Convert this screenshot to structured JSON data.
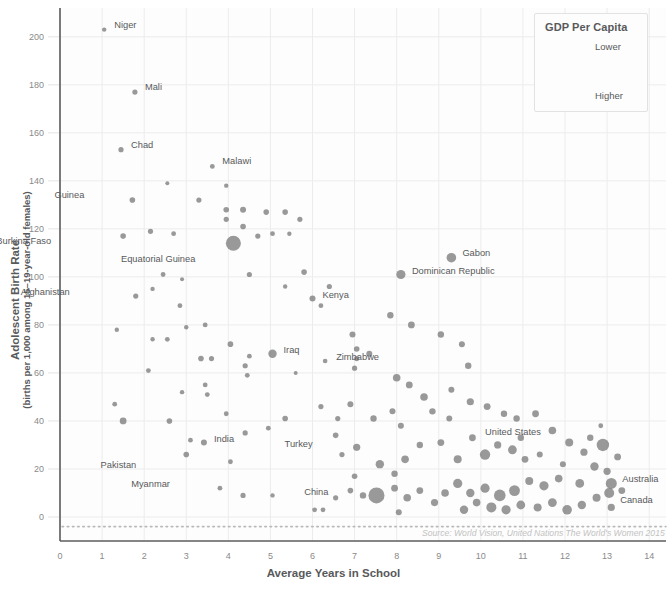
{
  "chart_data": {
    "type": "scatter",
    "title": "",
    "xlabel": "Average Years in School",
    "ylabel": "Adolescent Birth Rate",
    "ylabel_sub": "(births per 1,000 among 15–19-year-old females)",
    "xlim": [
      0,
      14.4
    ],
    "ylim": [
      -10,
      212
    ],
    "xticks": [
      0,
      1,
      2,
      3,
      4,
      5,
      6,
      7,
      8,
      9,
      10,
      11,
      12,
      13,
      14
    ],
    "yticks": [
      0,
      20,
      40,
      60,
      80,
      100,
      120,
      140,
      160,
      180,
      200
    ],
    "grid": true,
    "legend_position": "top-right",
    "size_encodes": "GDP Per Capita",
    "point_color": "#7c7c7c",
    "source": "Source: World Vision, United Nations The World's Women 2015",
    "legend": {
      "title": "GDP Per Capita",
      "low_label": "Lower",
      "high_label": "Higher",
      "arrow": "↓"
    },
    "labeled_points": [
      {
        "name": "Niger",
        "x": 1.05,
        "y": 203,
        "r": 2.2,
        "lx": 10,
        "ly": -5
      },
      {
        "name": "Mali",
        "x": 1.78,
        "y": 177,
        "r": 2.6,
        "lx": 10,
        "ly": -5
      },
      {
        "name": "Chad",
        "x": 1.45,
        "y": 153,
        "r": 2.6,
        "lx": 10,
        "ly": -5
      },
      {
        "name": "Malawi",
        "x": 3.62,
        "y": 146,
        "r": 2.4,
        "lx": 10,
        "ly": -5
      },
      {
        "name": "Guinea",
        "x": 1.72,
        "y": 132,
        "r": 2.8,
        "lx": -48,
        "ly": -5
      },
      {
        "name": "Burkina Faso",
        "x": 1.5,
        "y": 117,
        "r": 2.8,
        "lx": -72,
        "ly": 5
      },
      {
        "name": "Equatorial Guinea",
        "x": 4.12,
        "y": 114,
        "r": 7.5,
        "lx": -38,
        "ly": 16
      },
      {
        "name": "Afghanistan",
        "x": 1.8,
        "y": 92,
        "r": 2.6,
        "lx": -66,
        "ly": -4
      },
      {
        "name": "Gabon",
        "x": 9.3,
        "y": 108,
        "r": 4.8,
        "lx": 11,
        "ly": -5
      },
      {
        "name": "Dominican Republic",
        "x": 8.1,
        "y": 101,
        "r": 4.6,
        "lx": 11,
        "ly": -4
      },
      {
        "name": "Kenya",
        "x": 6.0,
        "y": 91,
        "r": 3.0,
        "lx": 10,
        "ly": -4
      },
      {
        "name": "Iraq",
        "x": 5.05,
        "y": 68,
        "r": 4.2,
        "lx": 11,
        "ly": -4
      },
      {
        "name": "Zimbabwe",
        "x": 6.3,
        "y": 65,
        "r": 2.3,
        "lx": 11,
        "ly": -4
      },
      {
        "name": "India",
        "x": 3.42,
        "y": 31,
        "r": 3.0,
        "lx": 10,
        "ly": -4
      },
      {
        "name": "Pakistan",
        "x": 3.0,
        "y": 26,
        "r": 2.8,
        "lx": -50,
        "ly": 10
      },
      {
        "name": "Myanmar",
        "x": 3.8,
        "y": 12,
        "r": 2.4,
        "lx": -50,
        "ly": -4
      },
      {
        "name": "Turkey",
        "x": 7.05,
        "y": 29,
        "r": 3.6,
        "lx": -44,
        "ly": -3
      },
      {
        "name": "China",
        "x": 7.52,
        "y": 9,
        "r": 8.0,
        "lx": -48,
        "ly": -3
      },
      {
        "name": "United States",
        "x": 12.9,
        "y": 30,
        "r": 6.2,
        "lx": -62,
        "ly": -13
      },
      {
        "name": "Australia",
        "x": 13.1,
        "y": 14,
        "r": 5.5,
        "lx": 11,
        "ly": -4
      },
      {
        "name": "Canada",
        "x": 13.05,
        "y": 10,
        "r": 5.0,
        "lx": 11,
        "ly": 7
      }
    ],
    "points": [
      {
        "x": 2.15,
        "y": 119,
        "r": 2.6
      },
      {
        "x": 2.55,
        "y": 139,
        "r": 2.0
      },
      {
        "x": 2.7,
        "y": 118,
        "r": 2.4
      },
      {
        "x": 3.3,
        "y": 132,
        "r": 2.6
      },
      {
        "x": 3.95,
        "y": 138,
        "r": 2.2
      },
      {
        "x": 3.95,
        "y": 128,
        "r": 2.8
      },
      {
        "x": 3.95,
        "y": 124,
        "r": 2.6
      },
      {
        "x": 4.35,
        "y": 128,
        "r": 3.0
      },
      {
        "x": 4.35,
        "y": 121,
        "r": 2.8
      },
      {
        "x": 4.9,
        "y": 127,
        "r": 2.8
      },
      {
        "x": 4.7,
        "y": 117,
        "r": 2.6
      },
      {
        "x": 5.35,
        "y": 127,
        "r": 2.8
      },
      {
        "x": 5.7,
        "y": 124,
        "r": 2.6
      },
      {
        "x": 5.05,
        "y": 118,
        "r": 2.4
      },
      {
        "x": 5.45,
        "y": 118,
        "r": 2.2
      },
      {
        "x": 2.45,
        "y": 101,
        "r": 2.4
      },
      {
        "x": 2.9,
        "y": 99,
        "r": 2.0
      },
      {
        "x": 2.2,
        "y": 95,
        "r": 2.2
      },
      {
        "x": 2.85,
        "y": 88,
        "r": 2.4
      },
      {
        "x": 4.5,
        "y": 101,
        "r": 2.6
      },
      {
        "x": 5.35,
        "y": 96,
        "r": 2.2
      },
      {
        "x": 5.8,
        "y": 102,
        "r": 2.8
      },
      {
        "x": 6.4,
        "y": 96,
        "r": 2.6
      },
      {
        "x": 6.2,
        "y": 88,
        "r": 2.4
      },
      {
        "x": 1.35,
        "y": 78,
        "r": 2.2
      },
      {
        "x": 2.2,
        "y": 74,
        "r": 2.2
      },
      {
        "x": 2.55,
        "y": 74,
        "r": 2.4
      },
      {
        "x": 3.0,
        "y": 79,
        "r": 2.2
      },
      {
        "x": 3.45,
        "y": 80,
        "r": 2.4
      },
      {
        "x": 4.05,
        "y": 72,
        "r": 2.8
      },
      {
        "x": 4.5,
        "y": 67,
        "r": 2.4
      },
      {
        "x": 4.4,
        "y": 63,
        "r": 2.6
      },
      {
        "x": 4.45,
        "y": 59,
        "r": 2.4
      },
      {
        "x": 5.6,
        "y": 60,
        "r": 2.0
      },
      {
        "x": 6.95,
        "y": 76,
        "r": 3.0
      },
      {
        "x": 7.05,
        "y": 70,
        "r": 2.8
      },
      {
        "x": 7.05,
        "y": 66,
        "r": 2.6
      },
      {
        "x": 7.0,
        "y": 62,
        "r": 2.6
      },
      {
        "x": 7.35,
        "y": 68,
        "r": 3.0
      },
      {
        "x": 7.85,
        "y": 84,
        "r": 3.2
      },
      {
        "x": 8.35,
        "y": 80,
        "r": 3.4
      },
      {
        "x": 8.0,
        "y": 58,
        "r": 3.8
      },
      {
        "x": 8.3,
        "y": 55,
        "r": 3.4
      },
      {
        "x": 8.65,
        "y": 50,
        "r": 3.8
      },
      {
        "x": 9.05,
        "y": 76,
        "r": 3.2
      },
      {
        "x": 9.55,
        "y": 72,
        "r": 3.0
      },
      {
        "x": 9.7,
        "y": 63,
        "r": 3.2
      },
      {
        "x": 9.3,
        "y": 53,
        "r": 3.0
      },
      {
        "x": 9.75,
        "y": 48,
        "r": 3.6
      },
      {
        "x": 10.15,
        "y": 46,
        "r": 3.4
      },
      {
        "x": 10.55,
        "y": 43,
        "r": 3.2
      },
      {
        "x": 1.3,
        "y": 47,
        "r": 2.4
      },
      {
        "x": 1.5,
        "y": 40,
        "r": 3.4
      },
      {
        "x": 2.1,
        "y": 61,
        "r": 2.4
      },
      {
        "x": 2.9,
        "y": 52,
        "r": 2.2
      },
      {
        "x": 3.35,
        "y": 66,
        "r": 2.8
      },
      {
        "x": 3.45,
        "y": 55,
        "r": 2.4
      },
      {
        "x": 3.5,
        "y": 51,
        "r": 2.4
      },
      {
        "x": 3.6,
        "y": 66,
        "r": 2.6
      },
      {
        "x": 3.95,
        "y": 43,
        "r": 2.4
      },
      {
        "x": 4.4,
        "y": 35,
        "r": 2.6
      },
      {
        "x": 4.95,
        "y": 37,
        "r": 2.4
      },
      {
        "x": 5.35,
        "y": 41,
        "r": 2.8
      },
      {
        "x": 6.2,
        "y": 46,
        "r": 2.6
      },
      {
        "x": 6.55,
        "y": 34,
        "r": 2.8
      },
      {
        "x": 6.6,
        "y": 41,
        "r": 2.6
      },
      {
        "x": 6.9,
        "y": 47,
        "r": 3.0
      },
      {
        "x": 7.45,
        "y": 41,
        "r": 3.2
      },
      {
        "x": 7.9,
        "y": 44,
        "r": 3.0
      },
      {
        "x": 8.1,
        "y": 38,
        "r": 3.0
      },
      {
        "x": 7.6,
        "y": 22,
        "r": 4.2
      },
      {
        "x": 8.2,
        "y": 24,
        "r": 3.8
      },
      {
        "x": 8.55,
        "y": 30,
        "r": 3.2
      },
      {
        "x": 9.05,
        "y": 31,
        "r": 3.4
      },
      {
        "x": 9.45,
        "y": 24,
        "r": 4.0
      },
      {
        "x": 9.8,
        "y": 33,
        "r": 3.4
      },
      {
        "x": 10.1,
        "y": 26,
        "r": 5.2
      },
      {
        "x": 10.4,
        "y": 30,
        "r": 3.6
      },
      {
        "x": 10.75,
        "y": 28,
        "r": 4.4
      },
      {
        "x": 11.05,
        "y": 24,
        "r": 3.4
      },
      {
        "x": 11.4,
        "y": 26,
        "r": 3.0
      },
      {
        "x": 11.7,
        "y": 36,
        "r": 3.8
      },
      {
        "x": 11.3,
        "y": 43,
        "r": 3.4
      },
      {
        "x": 10.85,
        "y": 41,
        "r": 3.2
      },
      {
        "x": 12.1,
        "y": 31,
        "r": 4.0
      },
      {
        "x": 12.45,
        "y": 27,
        "r": 3.6
      },
      {
        "x": 12.7,
        "y": 21,
        "r": 4.2
      },
      {
        "x": 13.25,
        "y": 25,
        "r": 3.4
      },
      {
        "x": 13.0,
        "y": 19,
        "r": 3.6
      },
      {
        "x": 12.35,
        "y": 14,
        "r": 4.4
      },
      {
        "x": 11.85,
        "y": 16,
        "r": 3.8
      },
      {
        "x": 11.5,
        "y": 13,
        "r": 4.6
      },
      {
        "x": 11.15,
        "y": 15,
        "r": 4.0
      },
      {
        "x": 10.8,
        "y": 11,
        "r": 5.4
      },
      {
        "x": 10.45,
        "y": 9,
        "r": 5.8
      },
      {
        "x": 10.1,
        "y": 12,
        "r": 4.6
      },
      {
        "x": 9.75,
        "y": 10,
        "r": 4.2
      },
      {
        "x": 9.45,
        "y": 14,
        "r": 4.6
      },
      {
        "x": 9.15,
        "y": 10,
        "r": 3.8
      },
      {
        "x": 10.25,
        "y": 4,
        "r": 5.0
      },
      {
        "x": 10.6,
        "y": 3,
        "r": 4.6
      },
      {
        "x": 10.95,
        "y": 5,
        "r": 4.4
      },
      {
        "x": 11.35,
        "y": 4,
        "r": 4.0
      },
      {
        "x": 11.7,
        "y": 6,
        "r": 4.4
      },
      {
        "x": 12.05,
        "y": 3,
        "r": 4.8
      },
      {
        "x": 12.4,
        "y": 5,
        "r": 4.2
      },
      {
        "x": 12.75,
        "y": 8,
        "r": 4.0
      },
      {
        "x": 13.1,
        "y": 4,
        "r": 3.6
      },
      {
        "x": 13.35,
        "y": 11,
        "r": 3.4
      },
      {
        "x": 9.6,
        "y": 3,
        "r": 4.2
      },
      {
        "x": 9.9,
        "y": 6,
        "r": 3.8
      },
      {
        "x": 8.9,
        "y": 6,
        "r": 3.6
      },
      {
        "x": 8.55,
        "y": 11,
        "r": 3.4
      },
      {
        "x": 8.25,
        "y": 8,
        "r": 3.8
      },
      {
        "x": 7.95,
        "y": 12,
        "r": 3.4
      },
      {
        "x": 8.05,
        "y": 2,
        "r": 3.0
      },
      {
        "x": 7.2,
        "y": 9,
        "r": 3.2
      },
      {
        "x": 6.9,
        "y": 11,
        "r": 2.8
      },
      {
        "x": 6.55,
        "y": 8,
        "r": 2.6
      },
      {
        "x": 6.05,
        "y": 3,
        "r": 2.4
      },
      {
        "x": 6.25,
        "y": 3,
        "r": 2.4
      },
      {
        "x": 5.05,
        "y": 9,
        "r": 2.2
      },
      {
        "x": 4.35,
        "y": 9,
        "r": 2.6
      },
      {
        "x": 7.0,
        "y": 17,
        "r": 2.8
      },
      {
        "x": 7.95,
        "y": 18,
        "r": 3.2
      },
      {
        "x": 12.85,
        "y": 38,
        "r": 2.4
      },
      {
        "x": 9.25,
        "y": 41,
        "r": 3.0
      },
      {
        "x": 8.85,
        "y": 44,
        "r": 3.2
      },
      {
        "x": 10.95,
        "y": 33,
        "r": 3.2
      },
      {
        "x": 11.95,
        "y": 22,
        "r": 3.0
      },
      {
        "x": 12.6,
        "y": 33,
        "r": 3.2
      },
      {
        "x": 6.7,
        "y": 26,
        "r": 2.6
      },
      {
        "x": 3.1,
        "y": 32,
        "r": 2.4
      },
      {
        "x": 2.6,
        "y": 40,
        "r": 2.8
      },
      {
        "x": 4.05,
        "y": 23,
        "r": 2.4
      }
    ]
  }
}
